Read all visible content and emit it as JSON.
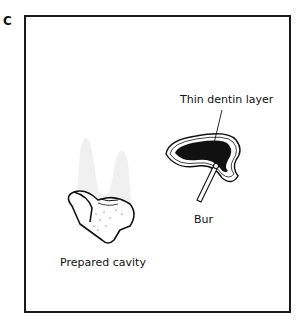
{
  "panel": {
    "label": "C"
  },
  "labels": {
    "dentin": "Thin dentin layer",
    "bur": "Bur",
    "cavity": "Prepared cavity"
  }
}
